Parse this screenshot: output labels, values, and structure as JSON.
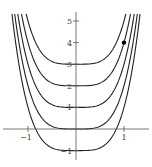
{
  "chart_data": {
    "type": "line",
    "title": "",
    "xlabel": "",
    "ylabel": "",
    "function": "y = 2x^4 + C",
    "series": [
      {
        "name": "C=-1",
        "C": -1
      },
      {
        "name": "C=0",
        "C": 0
      },
      {
        "name": "C=1",
        "C": 1
      },
      {
        "name": "C=2",
        "C": 2
      },
      {
        "name": "C=3",
        "C": 3
      }
    ],
    "highlight_point": {
      "x": 1,
      "y": 4
    },
    "xlim": [
      -1.5,
      1.5
    ],
    "ylim": [
      -1.4,
      5.4
    ],
    "x_ticks": [
      {
        "value": -1,
        "label": "−1"
      },
      {
        "value": 1,
        "label": "1"
      }
    ],
    "y_ticks": [
      {
        "value": 5,
        "label": "5"
      },
      {
        "value": 4,
        "label": "4"
      },
      {
        "value": 3,
        "label": "3"
      },
      {
        "value": 2,
        "label": "2"
      },
      {
        "value": 1,
        "label": "1"
      },
      {
        "value": -1,
        "label": "−1"
      }
    ],
    "grid": false,
    "legend": "none",
    "colors": {
      "curve": "#222222",
      "axis": "#555555",
      "point": "#000000"
    }
  }
}
